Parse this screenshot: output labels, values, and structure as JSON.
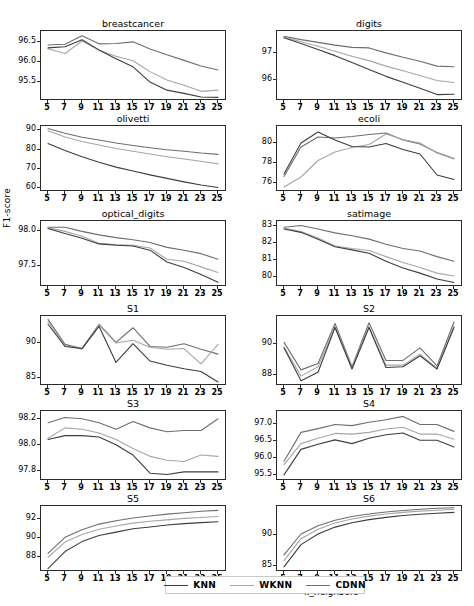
{
  "figure": {
    "width": 474,
    "height": 606,
    "ylabel": "F1-score",
    "xlabel": "k_neighbors"
  },
  "legend": {
    "position": "bottom-center",
    "items": [
      {
        "label": "KNN",
        "color": "#3d3d3d"
      },
      {
        "label": "WKNN",
        "color": "#a6a6a6"
      },
      {
        "label": "CDNN",
        "color": "#6e6e6e"
      }
    ]
  },
  "colors": {
    "knn": "#3d3d3d",
    "wknn": "#a6a6a6",
    "cdnn": "#6e6e6e",
    "axis": "#2a2a2a",
    "background": "#ffffff"
  },
  "chart_data": [
    {
      "type": "line",
      "title": "breastcancer",
      "xlabel": "k_neighbors",
      "ylabel": "F1-score",
      "grid": false,
      "x": [
        5,
        7,
        9,
        11,
        13,
        15,
        17,
        19,
        21,
        23,
        25
      ],
      "xticklabels": [
        "5",
        "7",
        "9",
        "11",
        "13",
        "15",
        "17",
        "19",
        "21",
        "23",
        "25"
      ],
      "yticks": [
        95.5,
        96.0,
        96.5
      ],
      "yticklabels": [
        "95.5",
        "96.0",
        "96.5"
      ],
      "ylim": [
        95.08,
        96.72
      ],
      "series": [
        {
          "name": "KNN",
          "values": [
            96.35,
            96.38,
            96.55,
            96.3,
            96.08,
            95.88,
            95.5,
            95.3,
            95.22,
            95.13,
            95.12
          ]
        },
        {
          "name": "WKNN",
          "values": [
            96.33,
            96.21,
            96.52,
            96.29,
            96.14,
            96.03,
            95.76,
            95.55,
            95.42,
            95.27,
            95.3
          ]
        },
        {
          "name": "CDNN",
          "values": [
            96.42,
            96.44,
            96.65,
            96.45,
            96.46,
            96.5,
            96.32,
            96.18,
            96.04,
            95.9,
            95.8
          ]
        }
      ]
    },
    {
      "type": "line",
      "title": "digits",
      "xlabel": "k_neighbors",
      "ylabel": "F1-score",
      "grid": false,
      "x": [
        5,
        7,
        9,
        11,
        13,
        15,
        17,
        19,
        21,
        23,
        25
      ],
      "xticklabels": [
        "5",
        "7",
        "9",
        "11",
        "13",
        "15",
        "17",
        "19",
        "21",
        "23",
        "25"
      ],
      "yticks": [
        96,
        97
      ],
      "yticklabels": [
        "96",
        "97"
      ],
      "ylim": [
        95.33,
        97.72
      ],
      "series": [
        {
          "name": "KNN",
          "values": [
            97.55,
            97.34,
            97.12,
            96.9,
            96.65,
            96.4,
            96.15,
            95.94,
            95.72,
            95.49,
            95.5
          ]
        },
        {
          "name": "WKNN",
          "values": [
            97.58,
            97.4,
            97.24,
            97.06,
            96.88,
            96.72,
            96.52,
            96.35,
            96.18,
            96.0,
            95.93
          ]
        },
        {
          "name": "CDNN",
          "values": [
            97.6,
            97.48,
            97.38,
            97.28,
            97.2,
            97.18,
            97.0,
            96.84,
            96.7,
            96.52,
            96.5
          ]
        }
      ]
    },
    {
      "type": "line",
      "title": "olivetti",
      "xlabel": "k_neighbors",
      "ylabel": "F1-score",
      "grid": false,
      "x": [
        5,
        7,
        9,
        11,
        13,
        15,
        17,
        19,
        21,
        23,
        25
      ],
      "xticklabels": [
        "5",
        "7",
        "9",
        "11",
        "13",
        "15",
        "17",
        "19",
        "21",
        "23",
        "25"
      ],
      "yticks": [
        60,
        70,
        80,
        90
      ],
      "yticklabels": [
        "60",
        "70",
        "80",
        "90"
      ],
      "ylim": [
        59.2,
        91.2
      ],
      "series": [
        {
          "name": "KNN",
          "values": [
            83.2,
            79.6,
            76.4,
            73.5,
            71.0,
            69.0,
            67.0,
            65.2,
            63.4,
            61.8,
            60.5
          ]
        },
        {
          "name": "WKNN",
          "values": [
            89.8,
            86.6,
            84.2,
            82.4,
            80.6,
            79.2,
            77.8,
            76.4,
            75.2,
            74.0,
            72.7
          ]
        },
        {
          "name": "CDNN",
          "values": [
            90.9,
            88.5,
            86.4,
            85.0,
            83.5,
            82.2,
            81.0,
            80.0,
            79.2,
            78.3,
            77.6
          ]
        }
      ]
    },
    {
      "type": "line",
      "title": "ecoli",
      "xlabel": "k_neighbors",
      "ylabel": "F1-score",
      "grid": false,
      "x": [
        5,
        7,
        9,
        11,
        13,
        15,
        17,
        19,
        21,
        23,
        25
      ],
      "xticklabels": [
        "5",
        "7",
        "9",
        "11",
        "13",
        "15",
        "17",
        "19",
        "21",
        "23",
        "25"
      ],
      "yticks": [
        76,
        78,
        80
      ],
      "yticklabels": [
        "76",
        "78",
        "80"
      ],
      "ylim": [
        75.25,
        81.45
      ],
      "series": [
        {
          "name": "KNN",
          "values": [
            76.85,
            79.95,
            81.05,
            80.25,
            79.6,
            79.55,
            79.9,
            79.3,
            78.85,
            76.75,
            76.3
          ]
        },
        {
          "name": "WKNN",
          "values": [
            75.55,
            76.55,
            78.2,
            79.05,
            79.5,
            79.8,
            80.85,
            80.3,
            79.95,
            78.95,
            78.35
          ]
        },
        {
          "name": "CDNN",
          "values": [
            76.6,
            79.55,
            80.55,
            80.45,
            80.6,
            80.8,
            80.95,
            80.25,
            79.85,
            79.0,
            78.4
          ]
        }
      ]
    },
    {
      "type": "line",
      "title": "optical_digits",
      "xlabel": "k_neighbors",
      "ylabel": "F1-score",
      "grid": false,
      "x": [
        5,
        7,
        9,
        11,
        13,
        15,
        17,
        19,
        21,
        23,
        25
      ],
      "xticklabels": [
        "5",
        "7",
        "9",
        "11",
        "13",
        "15",
        "17",
        "19",
        "21",
        "23",
        "25"
      ],
      "yticks": [
        97.5,
        98.0
      ],
      "yticklabels": [
        "97.5",
        "98.0"
      ],
      "ylim": [
        97.23,
        98.12
      ],
      "series": [
        {
          "name": "KNN",
          "values": [
            98.04,
            97.97,
            97.9,
            97.82,
            97.8,
            97.79,
            97.73,
            97.56,
            97.48,
            97.38,
            97.27
          ]
        },
        {
          "name": "WKNN",
          "values": [
            98.05,
            98.0,
            97.93,
            97.83,
            97.81,
            97.8,
            97.76,
            97.6,
            97.57,
            97.49,
            97.41
          ]
        },
        {
          "name": "CDNN",
          "values": [
            98.06,
            98.06,
            98.0,
            97.95,
            97.91,
            97.88,
            97.84,
            97.77,
            97.73,
            97.68,
            97.6
          ]
        }
      ]
    },
    {
      "type": "line",
      "title": "satimage",
      "xlabel": "k_neighbors",
      "ylabel": "F1-score",
      "grid": false,
      "x": [
        5,
        7,
        9,
        11,
        13,
        15,
        17,
        19,
        21,
        23,
        25
      ],
      "xticklabels": [
        "5",
        "7",
        "9",
        "11",
        "13",
        "15",
        "17",
        "19",
        "21",
        "23",
        "25"
      ],
      "yticks": [
        80,
        81,
        82,
        83
      ],
      "yticklabels": [
        "80",
        "81",
        "82",
        "83"
      ],
      "ylim": [
        79.55,
        83.2
      ],
      "series": [
        {
          "name": "KNN",
          "values": [
            82.85,
            82.65,
            82.25,
            81.8,
            81.62,
            81.42,
            80.95,
            80.55,
            80.25,
            79.9,
            79.7
          ]
        },
        {
          "name": "WKNN",
          "values": [
            82.9,
            82.7,
            82.32,
            81.85,
            81.7,
            81.58,
            81.22,
            80.88,
            80.58,
            80.25,
            80.08
          ]
        },
        {
          "name": "CDNN",
          "values": [
            82.95,
            83.05,
            82.85,
            82.62,
            82.45,
            82.25,
            81.95,
            81.7,
            81.55,
            81.22,
            80.95
          ]
        }
      ]
    },
    {
      "type": "line",
      "title": "S1",
      "xlabel": "k_neighbors",
      "ylabel": "F1-score",
      "grid": false,
      "x": [
        5,
        7,
        9,
        11,
        13,
        15,
        17,
        19,
        21,
        23,
        25
      ],
      "xticklabels": [
        "5",
        "7",
        "9",
        "11",
        "13",
        "15",
        "17",
        "19",
        "21",
        "23",
        "25"
      ],
      "yticks": [
        85,
        90
      ],
      "yticklabels": [
        "85",
        "90"
      ],
      "ylim": [
        84.1,
        93.6
      ],
      "series": [
        {
          "name": "KNN",
          "values": [
            92.7,
            89.5,
            89.2,
            92.4,
            87.2,
            89.9,
            87.4,
            86.8,
            86.3,
            85.9,
            84.4
          ]
        },
        {
          "name": "WKNN",
          "values": [
            93.1,
            89.6,
            89.1,
            92.6,
            90.0,
            90.4,
            89.4,
            89.1,
            89.2,
            87.0,
            89.8
          ]
        },
        {
          "name": "CDNN",
          "values": [
            93.4,
            89.8,
            89.2,
            92.7,
            90.1,
            92.2,
            89.5,
            89.4,
            89.9,
            89.1,
            88.4
          ]
        }
      ]
    },
    {
      "type": "line",
      "title": "S2",
      "xlabel": "k_neighbors",
      "ylabel": "F1-score",
      "grid": false,
      "x": [
        5,
        7,
        9,
        11,
        13,
        15,
        17,
        19,
        21,
        23,
        25
      ],
      "xticklabels": [
        "5",
        "7",
        "9",
        "11",
        "13",
        "15",
        "17",
        "19",
        "21",
        "23",
        "25"
      ],
      "yticks": [
        88,
        90
      ],
      "yticklabels": [
        "88",
        "90"
      ],
      "ylim": [
        87.45,
        91.65
      ],
      "series": [
        {
          "name": "KNN",
          "values": [
            89.75,
            87.65,
            88.2,
            91.05,
            88.4,
            91.05,
            88.5,
            88.55,
            89.25,
            88.4,
            91.05
          ]
        },
        {
          "name": "WKNN",
          "values": [
            89.8,
            87.95,
            88.55,
            91.1,
            88.45,
            91.1,
            88.65,
            88.65,
            89.35,
            88.45,
            91.15
          ]
        },
        {
          "name": "CDNN",
          "values": [
            90.1,
            88.35,
            88.75,
            91.3,
            88.55,
            91.35,
            88.95,
            88.95,
            89.75,
            88.6,
            91.4
          ]
        }
      ]
    },
    {
      "type": "line",
      "title": "S3",
      "xlabel": "k_neighbors",
      "ylabel": "F1-score",
      "grid": false,
      "x": [
        5,
        7,
        9,
        11,
        13,
        15,
        17,
        19,
        21,
        23,
        25
      ],
      "xticklabels": [
        "5",
        "7",
        "9",
        "11",
        "13",
        "15",
        "17",
        "19",
        "21",
        "23",
        "25"
      ],
      "yticks": [
        97.8,
        98.0,
        98.2
      ],
      "yticklabels": [
        "97.8",
        "98.0",
        "98.2"
      ],
      "ylim": [
        97.735,
        98.245
      ],
      "series": [
        {
          "name": "KNN",
          "values": [
            98.04,
            98.07,
            98.07,
            98.06,
            98.0,
            97.92,
            97.78,
            97.77,
            97.79,
            97.79,
            97.79
          ]
        },
        {
          "name": "WKNN",
          "values": [
            98.05,
            98.13,
            98.12,
            98.09,
            98.04,
            97.97,
            97.91,
            97.88,
            97.87,
            97.92,
            97.91
          ]
        },
        {
          "name": "CDNN",
          "values": [
            98.17,
            98.21,
            98.2,
            98.17,
            98.12,
            98.18,
            98.13,
            98.1,
            98.11,
            98.11,
            98.2
          ]
        }
      ]
    },
    {
      "type": "line",
      "title": "S4",
      "xlabel": "k_neighbors",
      "ylabel": "F1-score",
      "grid": false,
      "x": [
        5,
        7,
        9,
        11,
        13,
        15,
        17,
        19,
        21,
        23,
        25
      ],
      "xticklabels": [
        "5",
        "7",
        "9",
        "11",
        "13",
        "15",
        "17",
        "19",
        "21",
        "23",
        "25"
      ],
      "yticks": [
        95.5,
        96.0,
        96.5,
        97.0
      ],
      "yticklabels": [
        "95.5",
        "96.0",
        "96.5",
        "97.0"
      ],
      "ylim": [
        95.38,
        97.32
      ],
      "series": [
        {
          "name": "KNN",
          "values": [
            95.5,
            96.25,
            96.4,
            96.53,
            96.42,
            96.58,
            96.68,
            96.73,
            96.52,
            96.52,
            96.32
          ]
        },
        {
          "name": "WKNN",
          "values": [
            95.8,
            96.42,
            96.58,
            96.72,
            96.7,
            96.75,
            96.85,
            96.9,
            96.7,
            96.7,
            96.55
          ]
        },
        {
          "name": "CDNN",
          "values": [
            95.9,
            96.75,
            96.86,
            96.98,
            96.95,
            97.05,
            97.12,
            97.22,
            96.98,
            96.98,
            96.78
          ]
        }
      ]
    },
    {
      "type": "line",
      "title": "S5",
      "xlabel": "k_neighbors",
      "ylabel": "F1-score",
      "grid": false,
      "x": [
        5,
        7,
        9,
        11,
        13,
        15,
        17,
        19,
        21,
        23,
        25
      ],
      "xticklabels": [
        "5",
        "7",
        "9",
        "11",
        "13",
        "15",
        "17",
        "19",
        "21",
        "23",
        "25"
      ],
      "yticks": [
        88,
        90,
        92
      ],
      "yticklabels": [
        "88",
        "90",
        "92"
      ],
      "ylim": [
        86.6,
        93.15
      ],
      "series": [
        {
          "name": "KNN",
          "values": [
            86.75,
            88.55,
            89.6,
            90.25,
            90.6,
            90.95,
            91.15,
            91.35,
            91.5,
            91.6,
            91.7
          ]
        },
        {
          "name": "WKNN",
          "values": [
            87.95,
            89.55,
            90.35,
            90.9,
            91.25,
            91.55,
            91.75,
            91.9,
            92.05,
            92.15,
            92.25
          ]
        },
        {
          "name": "CDNN",
          "values": [
            88.35,
            90.05,
            90.85,
            91.45,
            91.8,
            92.1,
            92.3,
            92.5,
            92.65,
            92.8,
            92.9
          ]
        }
      ]
    },
    {
      "type": "line",
      "title": "S6",
      "xlabel": "k_neighbors",
      "ylabel": "F1-score",
      "grid": false,
      "x": [
        5,
        7,
        9,
        11,
        13,
        15,
        17,
        19,
        21,
        23,
        25
      ],
      "xticklabels": [
        "5",
        "7",
        "9",
        "11",
        "13",
        "15",
        "17",
        "19",
        "21",
        "23",
        "25"
      ],
      "yticks": [
        85,
        90
      ],
      "yticklabels": [
        "85",
        "90"
      ],
      "ylim": [
        84.35,
        94.25
      ],
      "series": [
        {
          "name": "KNN",
          "values": [
            84.85,
            88.4,
            90.1,
            91.2,
            91.9,
            92.4,
            92.75,
            93.05,
            93.25,
            93.4,
            93.55
          ]
        },
        {
          "name": "WKNN",
          "values": [
            85.85,
            89.35,
            90.85,
            91.85,
            92.5,
            92.95,
            93.3,
            93.55,
            93.75,
            93.9,
            94.05
          ]
        },
        {
          "name": "CDNN",
          "values": [
            86.75,
            90.1,
            91.4,
            92.3,
            92.9,
            93.3,
            93.6,
            93.85,
            94.05,
            94.2,
            94.3
          ]
        }
      ]
    }
  ]
}
